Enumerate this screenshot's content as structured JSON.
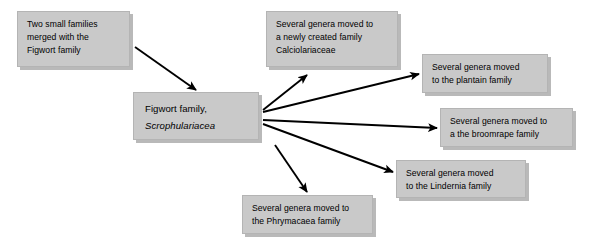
{
  "diagram": {
    "title_text": "",
    "accent_color": "#c9c9c9",
    "line_color": "#000000",
    "nodes": {
      "merged_families": {
        "lines": [
          "Two small families",
          "merged with the",
          "Figwort family"
        ]
      },
      "figwort_center": {
        "lines": [
          "Figwort family,",
          "Scrophulariacea"
        ]
      },
      "calciolariaceae": {
        "lines": [
          "Several genera moved to",
          "a newly created family",
          "Calciolariaceae"
        ]
      },
      "plantain": {
        "lines": [
          "Several genera moved",
          "to the plantain family"
        ]
      },
      "broomrape": {
        "lines": [
          "Several genera moved to",
          "a the broomrape family"
        ]
      },
      "lindernia": {
        "lines": [
          "Several genera moved",
          "to the Lindernia family"
        ]
      },
      "phrymacaea": {
        "lines": [
          "Several genera moved to",
          "the Phrymacaea family"
        ]
      }
    }
  }
}
